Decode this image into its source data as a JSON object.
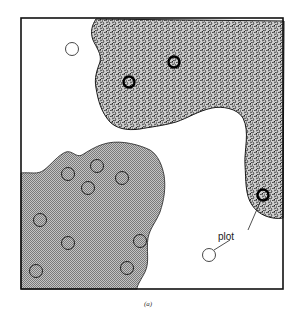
{
  "figure": {
    "caption": "(a)",
    "label": "plot",
    "colors": {
      "border": "#111111",
      "dark_region_base": "#9a9a9a",
      "gray_region": "#a8a8a8",
      "background": "#ffffff"
    },
    "regions": [
      {
        "name": "dark-stippled-region",
        "description": "upper right coarse stippled region"
      },
      {
        "name": "gray-fine-region",
        "description": "lower left fine halftone region"
      }
    ],
    "plots": {
      "white_open": [
        {
          "x": 72,
          "y": 49
        },
        {
          "x": 209,
          "y": 255
        }
      ],
      "bold_in_dark_region": [
        {
          "x": 129,
          "y": 82
        },
        {
          "x": 174,
          "y": 62
        },
        {
          "x": 263,
          "y": 195
        }
      ],
      "in_gray_region": [
        {
          "x": 68,
          "y": 174
        },
        {
          "x": 97,
          "y": 166
        },
        {
          "x": 88,
          "y": 188
        },
        {
          "x": 122,
          "y": 178
        },
        {
          "x": 40,
          "y": 220
        },
        {
          "x": 68,
          "y": 243
        },
        {
          "x": 140,
          "y": 241
        },
        {
          "x": 36,
          "y": 271
        },
        {
          "x": 127,
          "y": 268
        }
      ]
    }
  }
}
